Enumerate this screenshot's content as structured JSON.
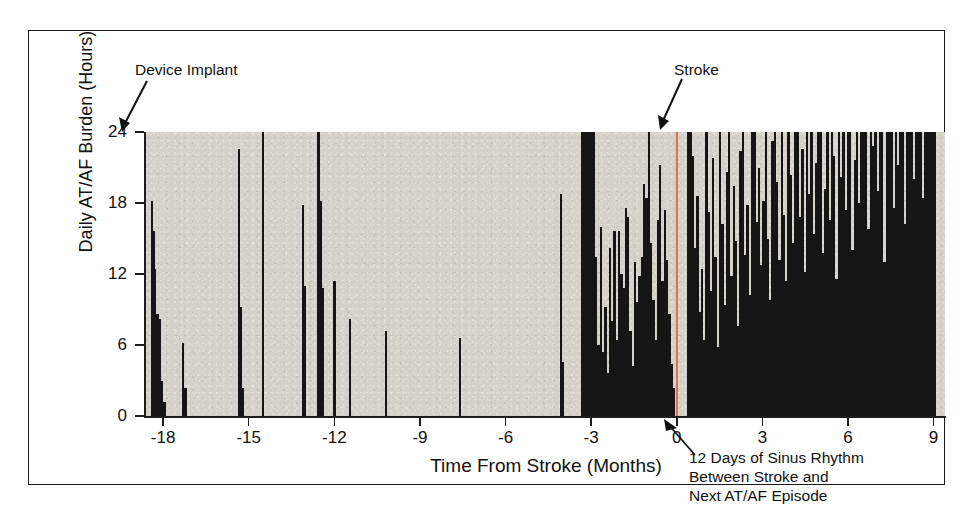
{
  "chart_data": {
    "type": "bar",
    "title": "",
    "xlabel": "Time From Stroke (Months)",
    "ylabel": "Daily AT/AF Burden (Hours)",
    "xlim": [
      -18.6,
      9.4
    ],
    "ylim": [
      0,
      24
    ],
    "xticks": [
      -18,
      -15,
      -12,
      -9,
      -6,
      -3,
      0,
      3,
      6,
      9
    ],
    "xticklabels": [
      "-18",
      "-15",
      "-12",
      "-9",
      "-6",
      "-3",
      "0",
      "3",
      "6",
      "9"
    ],
    "yticks": [
      0,
      6,
      12,
      18,
      24
    ],
    "yticklabels": [
      "0",
      "6",
      "12",
      "18",
      "24"
    ],
    "grid": false,
    "legend": null,
    "plot_background_color": "#d4d1c9",
    "bar_color": "#151515",
    "event_marker_color": "#e07050",
    "x_unit": "months from stroke",
    "y_unit": "hours per day",
    "annotations": [
      {
        "name": "device-implant",
        "text": "Device Implant",
        "points_to_x": -18.4,
        "points_to_y": 24
      },
      {
        "name": "stroke",
        "text": "Stroke",
        "points_to_x": 0,
        "points_to_y": 24
      },
      {
        "name": "sinus-rhythm-gap",
        "text": "12 Days of Sinus Rhythm\nBetween Stroke and\nNext AT/AF Episode",
        "points_to_x": 0.1,
        "points_to_y": 0
      }
    ],
    "event_line_x": 0,
    "x": [
      -18.4,
      -18.34,
      -18.28,
      -18.2,
      -18.12,
      -18.04,
      -17.95,
      -17.3,
      -17.22,
      -15.35,
      -15.28,
      -15.2,
      -14.5,
      -13.1,
      -13.02,
      -12.55,
      -12.48,
      -12.4,
      -12.0,
      -11.45,
      -10.2,
      -7.6,
      -4.05,
      -3.98,
      -3.3,
      -3.22,
      -3.14,
      -3.06,
      -2.98,
      -2.9,
      -2.82,
      -2.74,
      -2.66,
      -2.58,
      -2.5,
      -2.42,
      -2.34,
      -2.26,
      -2.18,
      -2.1,
      -2.02,
      -1.94,
      -1.86,
      -1.78,
      -1.7,
      -1.62,
      -1.54,
      -1.46,
      -1.38,
      -1.3,
      -1.22,
      -1.14,
      -1.06,
      -0.98,
      -0.9,
      -0.82,
      -0.74,
      -0.66,
      -0.58,
      -0.5,
      -0.42,
      -0.34,
      -0.26,
      -0.18,
      -0.1,
      0.4,
      0.48,
      0.56,
      0.64,
      0.72,
      0.8,
      0.88,
      0.96,
      1.04,
      1.12,
      1.2,
      1.28,
      1.36,
      1.44,
      1.52,
      1.6,
      1.68,
      1.76,
      1.84,
      1.92,
      2.0,
      2.08,
      2.16,
      2.24,
      2.32,
      2.4,
      2.48,
      2.56,
      2.64,
      2.72,
      2.8,
      2.88,
      2.96,
      3.04,
      3.12,
      3.2,
      3.28,
      3.36,
      3.44,
      3.52,
      3.6,
      3.68,
      3.76,
      3.84,
      3.92,
      4.0,
      4.08,
      4.16,
      4.24,
      4.32,
      4.4,
      4.48,
      4.56,
      4.64,
      4.72,
      4.8,
      4.88,
      4.96,
      5.04,
      5.12,
      5.2,
      5.28,
      5.36,
      5.44,
      5.52,
      5.6,
      5.68,
      5.76,
      5.84,
      5.92,
      6.0,
      6.08,
      6.16,
      6.24,
      6.32,
      6.4,
      6.48,
      6.56,
      6.64,
      6.72,
      6.8,
      6.88,
      6.96,
      7.04,
      7.12,
      7.2,
      7.28,
      7.36,
      7.44,
      7.52,
      7.6,
      7.68,
      7.76,
      7.84,
      7.92,
      8.0,
      8.08,
      8.16,
      8.24,
      8.32,
      8.4,
      8.48,
      8.56,
      8.64,
      8.72,
      8.8,
      8.88,
      8.96,
      9.04
    ],
    "values": [
      18.2,
      15.6,
      12.4,
      8.6,
      8.2,
      3.0,
      1.2,
      6.2,
      2.4,
      22.6,
      9.2,
      2.4,
      24.0,
      17.8,
      11.0,
      24.0,
      18.2,
      10.8,
      11.4,
      8.2,
      7.2,
      6.6,
      18.8,
      4.6,
      24.0,
      24.0,
      24.0,
      24.0,
      24.0,
      24.0,
      13.4,
      6.0,
      16.0,
      5.4,
      9.2,
      3.6,
      14.2,
      8.0,
      15.6,
      6.4,
      15.6,
      12.0,
      10.8,
      17.6,
      16.8,
      7.2,
      4.2,
      13.0,
      9.6,
      11.8,
      13.4,
      19.6,
      18.4,
      24.0,
      14.6,
      9.8,
      6.4,
      16.6,
      21.2,
      11.4,
      17.4,
      13.2,
      8.6,
      4.4,
      2.4,
      24.0,
      24.0,
      22.0,
      14.2,
      18.6,
      8.8,
      12.4,
      6.4,
      24.0,
      17.2,
      10.6,
      21.8,
      13.4,
      5.8,
      24.0,
      16.2,
      9.4,
      20.6,
      24.0,
      11.8,
      19.4,
      14.8,
      7.6,
      22.4,
      24.0,
      13.6,
      17.8,
      10.2,
      24.0,
      24.0,
      16.4,
      21.0,
      12.8,
      18.2,
      24.0,
      15.0,
      9.8,
      23.2,
      24.0,
      19.8,
      13.2,
      24.0,
      17.0,
      11.4,
      24.0,
      20.4,
      14.6,
      24.0,
      24.0,
      16.8,
      22.6,
      12.2,
      24.0,
      18.8,
      24.0,
      15.4,
      21.4,
      24.0,
      24.0,
      13.8,
      19.2,
      24.0,
      16.6,
      24.0,
      22.0,
      11.6,
      24.0,
      20.2,
      24.0,
      17.4,
      24.0,
      24.0,
      14.0,
      21.6,
      24.0,
      18.0,
      24.0,
      24.0,
      24.0,
      15.8,
      24.0,
      22.8,
      24.0,
      19.0,
      24.0,
      24.0,
      13.0,
      24.0,
      24.0,
      24.0,
      17.6,
      24.0,
      21.2,
      24.0,
      24.0,
      16.2,
      24.0,
      24.0,
      24.0,
      20.0,
      24.0,
      24.0,
      24.0,
      18.4,
      24.0,
      24.0,
      24.0,
      24.0,
      24.0
    ]
  },
  "axis": {
    "y_title": "Daily AT/AF Burden (Hours)",
    "x_title": "Time From Stroke (Months)",
    "y_labels": [
      "24",
      "18",
      "12",
      "6",
      "0"
    ],
    "x_labels": [
      "-18",
      "-15",
      "-12",
      "-9",
      "-6",
      "-3",
      "0",
      "3",
      "6",
      "9"
    ]
  },
  "annotations": {
    "device_implant": "Device Implant",
    "stroke": "Stroke",
    "sinus_rhythm": "12 Days of Sinus Rhythm\nBetween Stroke and\nNext AT/AF Episode"
  }
}
